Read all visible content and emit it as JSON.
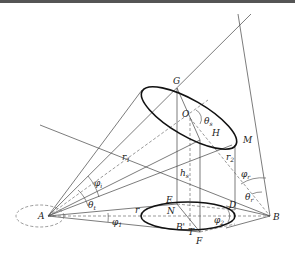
{
  "diagram": {
    "type": "geometry-cone-projection",
    "colors": {
      "line": "#444444",
      "ellipse": "#111111",
      "background": "#ffffff",
      "topbar": "#555555"
    },
    "points": {
      "A": "A",
      "B": "B",
      "G": "G",
      "H": "H",
      "M": "M",
      "O": "O",
      "E": "E",
      "N": "N",
      "F": "F",
      "D": "D",
      "T": "T",
      "Bp": "B'"
    },
    "lengths": {
      "r1": "r",
      "r1_sub": "1",
      "r2": "r",
      "r2_sub": "2",
      "r": "r",
      "hs": "h",
      "hs_sub": "s"
    },
    "angles": {
      "theta_s": "θ",
      "theta_s_sub": "s",
      "theta_t": "θ",
      "theta_t_sub": "t",
      "theta_r": "θ",
      "theta_r_sub": "r",
      "phi_i": "φ",
      "phi_i_sub": "i",
      "phi_r": "φ",
      "phi_r_sub": "r",
      "phi_1": "φ",
      "phi_1_sub": "1",
      "phi_2": "φ",
      "phi_2_sub": "2"
    }
  }
}
